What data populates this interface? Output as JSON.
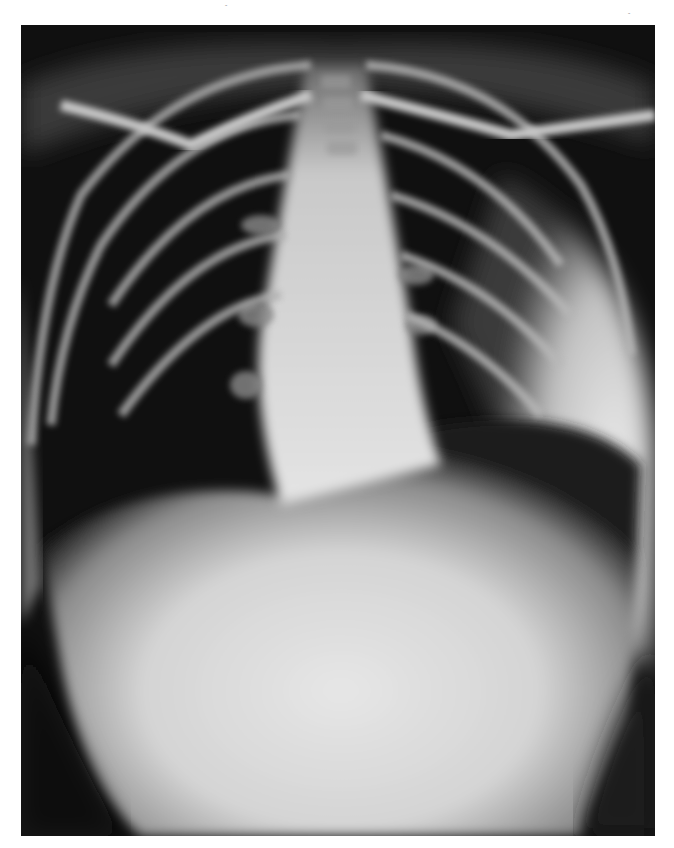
{
  "image": {
    "kind": "radiograph",
    "view": "frontal chest X-ray",
    "description": "Frontal chest radiograph showing dark air-filled lungs, bright central mediastinum and spine, curved ribs and clavicles, and a large bright opacity filling the lower chest and abdomen.",
    "colors": {
      "film_background": "#0e0e0e",
      "lung": "#141414",
      "bone": "#c8c8c8",
      "soft_tissue_bright": "#e2e2e2",
      "page_background": "#ffffff"
    }
  },
  "margin_marks": [
    "ˆ",
    "ˆ"
  ]
}
